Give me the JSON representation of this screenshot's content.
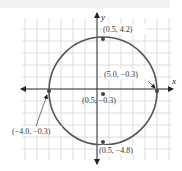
{
  "diagram": {
    "type": "circle-on-coordinate-grid",
    "axes": {
      "x_label": "x",
      "y_label": "y"
    },
    "center": {
      "label": "(0.5, −0.3)",
      "x": 0.5,
      "y": -0.3
    },
    "points": [
      {
        "id": "top",
        "label": "(0.5, 4.2)",
        "x": 0.5,
        "y": 4.2
      },
      {
        "id": "right",
        "label": "(5.0, −0.3)",
        "x": 5.0,
        "y": -0.3
      },
      {
        "id": "left",
        "label": "(−4.0, −0.3)",
        "x": -4.0,
        "y": -0.3
      },
      {
        "id": "bottom",
        "label": "(0.5, −4.8)",
        "x": 0.5,
        "y": -4.8
      }
    ],
    "radius": 4.5,
    "colors": {
      "circle": "#555555",
      "grid": "#d6d6d6",
      "axis": "#222222",
      "point": "#444444"
    }
  }
}
